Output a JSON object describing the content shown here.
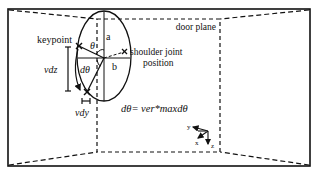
{
  "figure": {
    "labels": {
      "door_plane": "door plane",
      "keypoint": "keypoint",
      "shoulder_line1": "shoulder joint",
      "shoulder_line2": "position",
      "a": "a",
      "b": "b",
      "theta": "θ",
      "dtheta": "dθ",
      "vdz": "vdz",
      "vdy": "vdy",
      "equation": "dθ= ver*maxdθ"
    },
    "axes": {
      "y": "y",
      "x": "x",
      "z": "z"
    },
    "colors": {
      "stroke": "#111111",
      "background": "#ffffff"
    }
  }
}
